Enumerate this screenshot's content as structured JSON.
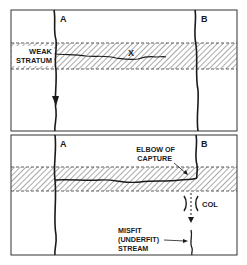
{
  "top_panel": {
    "labels": {
      "river_a": "A",
      "river_b": "B",
      "weak_line1": "WEAK",
      "weak_line2": "STRATUM",
      "x_mark": "X"
    }
  },
  "bottom_panel": {
    "labels": {
      "river_a": "A",
      "river_b": "B",
      "elbow_line1": "ELBOW OF",
      "elbow_line2": "CAPTURE",
      "col": "COL",
      "misfit_line1": "MISFIT",
      "misfit_line2": "(UNDERFIT)",
      "misfit_line3": "STREAM"
    }
  },
  "colors": {
    "ink": "#1a1a1a",
    "frame": "#333333",
    "hatch": "#555555"
  }
}
